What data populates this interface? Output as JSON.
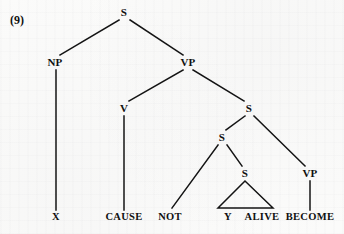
{
  "example": {
    "number_label": "(9)"
  },
  "figure": {
    "type": "syntax-tree",
    "ink_color": "#141414",
    "background_color": "#fbfbfa"
  },
  "tree": {
    "nodes": [
      {
        "id": "s-root",
        "label": "S",
        "x": 124,
        "y": 12,
        "kind": "nonterminal"
      },
      {
        "id": "np",
        "label": "NP",
        "x": 55,
        "y": 62,
        "kind": "nonterminal"
      },
      {
        "id": "vp-main",
        "label": "VP",
        "x": 188,
        "y": 62,
        "kind": "nonterminal"
      },
      {
        "id": "v",
        "label": "V",
        "x": 124,
        "y": 108,
        "kind": "nonterminal"
      },
      {
        "id": "s-embedded",
        "label": "S",
        "x": 249,
        "y": 108,
        "kind": "nonterminal"
      },
      {
        "id": "s-neg",
        "label": "S",
        "x": 222,
        "y": 137,
        "kind": "nonterminal"
      },
      {
        "id": "s-small",
        "label": "S",
        "x": 245,
        "y": 173,
        "kind": "nonterminal"
      },
      {
        "id": "vp-become",
        "label": "VP",
        "x": 310,
        "y": 173,
        "kind": "nonterminal"
      }
    ],
    "terminals": [
      {
        "id": "x",
        "label": "X",
        "x": 56,
        "y": 217
      },
      {
        "id": "cause",
        "label": "CAUSE",
        "x": 124,
        "y": 217
      },
      {
        "id": "not",
        "label": "NOT",
        "x": 170,
        "y": 217
      },
      {
        "id": "y",
        "label": "Y",
        "x": 228,
        "y": 217
      },
      {
        "id": "alive",
        "label": "ALIVE",
        "x": 262,
        "y": 217
      },
      {
        "id": "become",
        "label": "BECOME",
        "x": 310,
        "y": 217
      }
    ],
    "edges": [
      {
        "id": "edge-s-np",
        "from": "s-root",
        "to": "np",
        "x1": 119,
        "y1": 20,
        "x2": 60,
        "y2": 55
      },
      {
        "id": "edge-s-vp",
        "from": "s-root",
        "to": "vp-main",
        "x1": 130,
        "y1": 20,
        "x2": 183,
        "y2": 55
      },
      {
        "id": "edge-np-x",
        "from": "np",
        "to": "x",
        "x1": 56,
        "y1": 70,
        "x2": 56,
        "y2": 210
      },
      {
        "id": "edge-vp-v",
        "from": "vp-main",
        "to": "v",
        "x1": 183,
        "y1": 70,
        "x2": 129,
        "y2": 101
      },
      {
        "id": "edge-vp-s",
        "from": "vp-main",
        "to": "s-embedded",
        "x1": 193,
        "y1": 70,
        "x2": 244,
        "y2": 101
      },
      {
        "id": "edge-v-cause",
        "from": "v",
        "to": "cause",
        "x1": 124,
        "y1": 116,
        "x2": 124,
        "y2": 210
      },
      {
        "id": "edge-semb-sneg",
        "from": "s-embedded",
        "to": "s-neg",
        "x1": 245,
        "y1": 116,
        "x2": 226,
        "y2": 130
      },
      {
        "id": "edge-semb-vpbecome",
        "from": "s-embedded",
        "to": "vp-become",
        "x1": 254,
        "y1": 116,
        "x2": 305,
        "y2": 166
      },
      {
        "id": "edge-sneg-not",
        "from": "s-neg",
        "to": "not",
        "x1": 218,
        "y1": 145,
        "x2": 172,
        "y2": 208
      },
      {
        "id": "edge-sneg-ssmall",
        "from": "s-neg",
        "to": "s-small",
        "x1": 227,
        "y1": 145,
        "x2": 242,
        "y2": 166
      },
      {
        "id": "edge-vpbecome-term",
        "from": "vp-become",
        "to": "become",
        "x1": 310,
        "y1": 181,
        "x2": 310,
        "y2": 210
      }
    ],
    "triangle": {
      "id": "triangle-y-alive",
      "apex_x": 245,
      "apex_y": 181,
      "left_x": 218,
      "right_x": 273,
      "base_y": 208,
      "covers": "Y ALIVE"
    }
  }
}
